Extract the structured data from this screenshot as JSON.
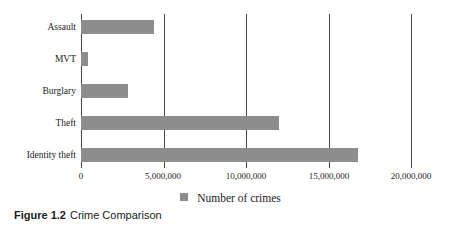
{
  "caption": {
    "number": "Figure 1.2",
    "title": "Crime Comparison"
  },
  "colors": {
    "bar": "#8d8d8d",
    "axis": "#4a4a4a",
    "text": "#1b1b1b",
    "background": "#ffffff"
  },
  "chart_data": {
    "type": "bar",
    "orientation": "horizontal",
    "title": "Crime Comparison",
    "xlabel": "",
    "ylabel": "",
    "categories": [
      "Assault",
      "MVT",
      "Burglary",
      "Theft",
      "Identity theft"
    ],
    "values": [
      4400000,
      400000,
      2850000,
      12000000,
      16800000
    ],
    "series": [
      {
        "name": "Number of crimes",
        "values": [
          4400000,
          400000,
          2850000,
          12000000,
          16800000
        ]
      }
    ],
    "xlim": [
      0,
      20000000
    ],
    "xticks": [
      0,
      5000000,
      10000000,
      15000000,
      20000000
    ],
    "xtick_labels": [
      "0",
      "5,000,000",
      "10,000,000",
      "15,000,000",
      "20,000,000"
    ],
    "grid": "vertical",
    "legend": {
      "position": "bottom",
      "entries": [
        "Number of crimes"
      ]
    }
  }
}
